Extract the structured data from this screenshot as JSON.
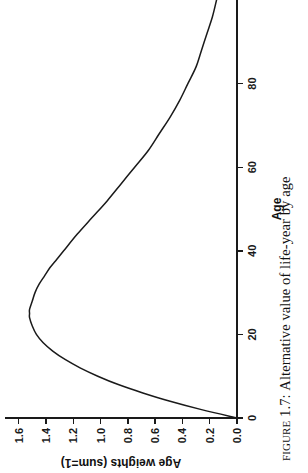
{
  "figure": {
    "caption_prefix": "Figure",
    "caption_number": "1.7:",
    "caption_text": "Alternative value of life-year by age",
    "caption_full": "Figure 1.7: Alternative value of life-year by age"
  },
  "chart_data": {
    "type": "line",
    "title": "",
    "xlabel": "Age",
    "ylabel": "Age weights (sum=1)",
    "xlim": [
      0,
      100
    ],
    "ylim": [
      0.0,
      1.7
    ],
    "xticks": [
      "0",
      "20",
      "40",
      "60",
      "80"
    ],
    "xtick_values": [
      0,
      20,
      40,
      60,
      80
    ],
    "yticks": [
      "0.0",
      "0.2",
      "0.4",
      "0.6",
      "0.8",
      "1.0",
      "1.2",
      "1.4",
      "1.6"
    ],
    "ytick_values": [
      0.0,
      0.2,
      0.4,
      0.6,
      0.8,
      1.0,
      1.2,
      1.4,
      1.6
    ],
    "grid": false,
    "legend": false,
    "line_color": "#1a1a1a",
    "orientation": "rotated-90-ccw",
    "peak_age": 25,
    "peak_value": 1.52,
    "x": [
      0,
      2,
      4,
      6,
      8,
      10,
      12,
      14,
      16,
      18,
      20,
      22,
      24,
      25,
      26,
      28,
      30,
      32,
      34,
      36,
      38,
      40,
      44,
      48,
      52,
      56,
      60,
      64,
      68,
      72,
      76,
      80,
      84,
      88,
      92,
      96,
      100
    ],
    "y": [
      0.0,
      0.26,
      0.49,
      0.69,
      0.87,
      1.02,
      1.15,
      1.26,
      1.35,
      1.42,
      1.47,
      1.5,
      1.52,
      1.52,
      1.52,
      1.5,
      1.48,
      1.45,
      1.41,
      1.37,
      1.32,
      1.27,
      1.17,
      1.06,
      0.95,
      0.85,
      0.75,
      0.65,
      0.57,
      0.49,
      0.42,
      0.36,
      0.3,
      0.26,
      0.22,
      0.18,
      0.15
    ],
    "series": [
      {
        "name": "Age weights (sum=1)",
        "values": [
          0.0,
          0.26,
          0.49,
          0.69,
          0.87,
          1.02,
          1.15,
          1.26,
          1.35,
          1.42,
          1.47,
          1.5,
          1.52,
          1.52,
          1.52,
          1.5,
          1.48,
          1.45,
          1.41,
          1.37,
          1.32,
          1.27,
          1.17,
          1.06,
          0.95,
          0.85,
          0.75,
          0.65,
          0.57,
          0.49,
          0.42,
          0.36,
          0.3,
          0.26,
          0.22,
          0.18,
          0.15
        ]
      }
    ]
  }
}
